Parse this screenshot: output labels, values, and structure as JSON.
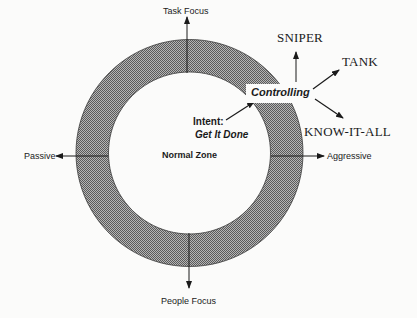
{
  "diagram": {
    "type": "ring-quadrant",
    "colors": {
      "background": "#fbfbfa",
      "ring_fill": "#8a8a8a",
      "ring_stroke": "#3a3a3a",
      "line": "#1a1a1a",
      "text": "#1a1a1a"
    },
    "ring": {
      "cx": 189.5,
      "cy": 153,
      "outer_r": 113.5,
      "inner_r": 81
    },
    "axes": {
      "top": "Task Focus",
      "bottom": "People Focus",
      "left": "Passive",
      "right": "Aggressive"
    },
    "center_label": "Normal Zone",
    "intent": {
      "label": "Intent:",
      "value": "Get It Done"
    },
    "behavior": {
      "label": "Controlling",
      "outcomes": [
        "SNIPER",
        "TANK",
        "KNOW-IT-ALL"
      ]
    }
  }
}
